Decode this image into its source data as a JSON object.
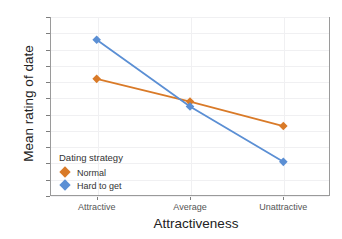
{
  "chart_data": {
    "type": "line",
    "title": "",
    "xlabel": "Attractiveness",
    "ylabel": "Mean rating of date",
    "categories": [
      "Attractive",
      "Average",
      "Unattractive"
    ],
    "series": [
      {
        "name": "Normal",
        "color": "#D97A28",
        "values": [
          76.0,
          69.0,
          61.5
        ]
      },
      {
        "name": "Hard to get",
        "color": "#5B8FD4",
        "values": [
          88.0,
          67.5,
          50.5
        ]
      }
    ],
    "ylim": [
      40,
      95
    ],
    "yticks": [
      40,
      45,
      50,
      55,
      60,
      65,
      70,
      75,
      80,
      85,
      90,
      95
    ],
    "ytick_labels": [
      "40",
      "45",
      "50",
      "55",
      "60",
      "65",
      "70",
      "75",
      "80",
      "85",
      "90",
      "95"
    ],
    "grid": true,
    "legend_position": "inside-bottom-left",
    "marker": "diamond"
  },
  "legend": {
    "title": "Dating strategy",
    "entries": [
      {
        "label": "Normal",
        "color": "#D97A28"
      },
      {
        "label": "Hard to get",
        "color": "#5B8FD4"
      }
    ]
  }
}
